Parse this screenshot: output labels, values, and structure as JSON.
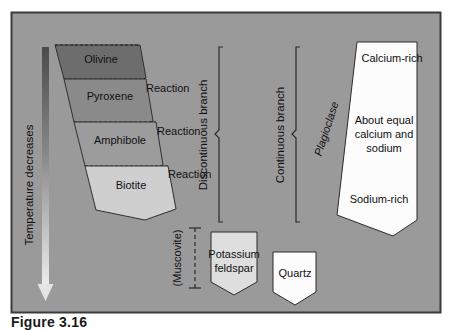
{
  "figure": {
    "caption": "Figure 3.16",
    "frame_color": "#3a3a3a",
    "background_color": "#9a9a9a"
  },
  "temperature_axis": {
    "label": "Temperature decreases",
    "arrow_name": "temperature-decrease-arrow",
    "gradient_top_color": "#4a4a4a",
    "gradient_bottom_color": "#e8e8e8"
  },
  "discontinuous_branch": {
    "label": "Discontinuous branch",
    "minerals": [
      {
        "name": "Olivine",
        "fill": "#6d6d6d"
      },
      {
        "name": "Pyroxene",
        "fill": "#8a8a8a"
      },
      {
        "name": "Amphibole",
        "fill": "#9c9c9c"
      },
      {
        "name": "Biotite",
        "fill": "#cfcfcf"
      }
    ],
    "reaction_labels": [
      "Reaction",
      "Reaction",
      "Reaction"
    ]
  },
  "continuous_branch": {
    "label": "Continuous branch",
    "series_name": "Plagioclase",
    "zones": [
      "Calcium-rich",
      "About equal",
      "calcium and",
      "sodium",
      "Sodium-rich"
    ],
    "fill": "#fcfcfc"
  },
  "late_minerals": {
    "muscovite": "(Muscovite)",
    "potassium_feldspar_line1": "Potassium",
    "potassium_feldspar_line2": "feldspar",
    "potassium_feldspar_fill": "#dedede",
    "quartz": "Quartz",
    "quartz_fill": "#fcfcfc"
  }
}
